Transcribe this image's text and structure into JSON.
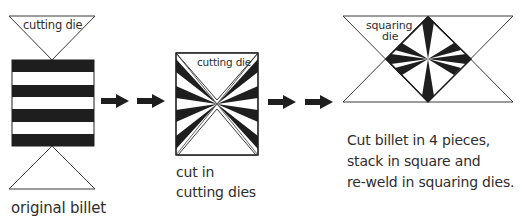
{
  "diagram": {
    "stage1": {
      "die_label": "cutting die",
      "caption": "original billet"
    },
    "stage2": {
      "die_label": "cutting die",
      "caption_lines": [
        "cut in",
        "cutting dies"
      ]
    },
    "stage3": {
      "die_label_lines": [
        "squaring",
        "die"
      ],
      "caption_lines": [
        "Cut billet in 4 pieces,",
        "stack in square and",
        "re-weld in squaring dies."
      ]
    },
    "arrows": [
      "arrow-right",
      "arrow-right",
      "arrow-right",
      "arrow-right"
    ],
    "colors": {
      "ink": "#1e1e1e",
      "line": "#3a3a3a",
      "background": "#ffffff"
    }
  }
}
